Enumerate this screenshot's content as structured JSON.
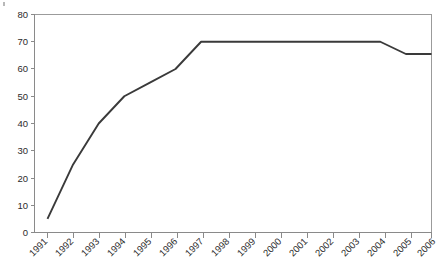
{
  "chart_data": {
    "type": "line",
    "title": "",
    "subtitle": "",
    "xlabel": "",
    "ylabel": "",
    "categories": [
      "1991",
      "1992",
      "1993",
      "1994",
      "1995",
      "1996",
      "1997",
      "1998",
      "1999",
      "2000",
      "2001",
      "2002",
      "2003",
      "2004",
      "2005",
      "2006"
    ],
    "values": [
      5,
      25,
      40,
      50,
      55,
      60,
      70,
      70,
      70,
      70,
      70,
      70,
      70,
      70,
      65.5,
      65.5
    ],
    "series": [
      {
        "name": "series-1",
        "values": [
          5,
          25,
          40,
          50,
          55,
          60,
          70,
          70,
          70,
          70,
          70,
          70,
          70,
          70,
          65.5,
          65.5
        ],
        "color": "#3a3a3a"
      }
    ],
    "x": [
      "1991",
      "1992",
      "1993",
      "1994",
      "1995",
      "1996",
      "1997",
      "1998",
      "1999",
      "2000",
      "2001",
      "2002",
      "2003",
      "2004",
      "2005",
      "2006"
    ],
    "xlim": [
      "1991",
      "2006"
    ],
    "ylim": [
      0,
      80
    ],
    "yticks": [
      0,
      10,
      20,
      30,
      40,
      50,
      60,
      70,
      80
    ],
    "ytick_labels": [
      "0",
      "10",
      "20",
      "30",
      "40",
      "50",
      "60",
      "70",
      "80"
    ],
    "xtick_labels": [
      "1991",
      "1992",
      "1993",
      "1994",
      "1995",
      "1996",
      "1997",
      "1998",
      "1999",
      "2000",
      "2001",
      "2002",
      "2003",
      "2004",
      "2005",
      "2006"
    ],
    "grid": false,
    "legend": false,
    "legend_position": "none",
    "annotations": [],
    "colors": {
      "line": "#3a3a3a",
      "axis": "#8a8a8a",
      "frame": "#9b9b9b",
      "text": "#2b2b2b",
      "background": "#ffffff"
    }
  }
}
